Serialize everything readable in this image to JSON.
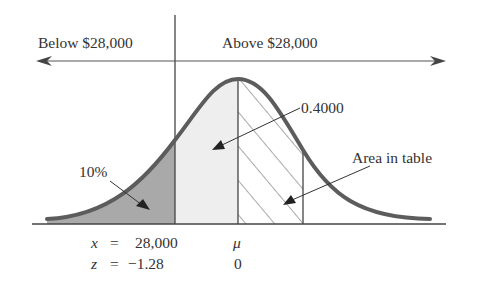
{
  "diagram": {
    "type": "normal-distribution-area",
    "labels": {
      "below": "Below $28,000",
      "above": "Above $28,000",
      "tail_percent": "10%",
      "middle_area": "0.4000",
      "area_in_table": "Area in table",
      "x_var": "x",
      "x_eq": "=",
      "x_value": "28,000",
      "z_var": "z",
      "z_eq": "=",
      "z_value": "−1.28",
      "mu": "μ",
      "zero": "0"
    },
    "colors": {
      "curve": "#5a5a5a",
      "left_tail_fill": "#a8a8a8",
      "middle_fill": "#ececec",
      "lines": "#444444",
      "text": "#333333"
    },
    "regions": [
      {
        "name": "left-tail",
        "area": "10%",
        "from_z": "-inf",
        "to_z": "-1.28"
      },
      {
        "name": "middle",
        "area": "0.4000",
        "from_z": "-1.28",
        "to_z": "0"
      },
      {
        "name": "table-area",
        "label": "Area in table",
        "from_z": "0",
        "to_z": "1.28"
      }
    ]
  }
}
